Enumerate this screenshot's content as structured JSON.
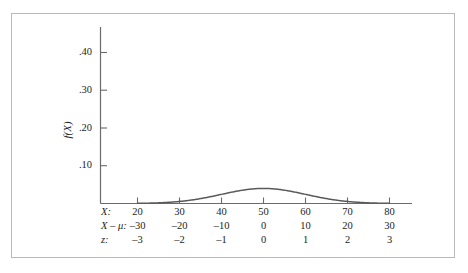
{
  "figure": {
    "border_color": "#b9b9b9",
    "background": "#ffffff"
  },
  "axes": {
    "curve_color": "#5a5a5a",
    "axis_color": "#6b6b6b",
    "y_title": "f(X)",
    "y_ticks": [
      ".10",
      ".20",
      ".30",
      ".40"
    ]
  },
  "rows": [
    {
      "name": "X:",
      "values": [
        "20",
        "30",
        "40",
        "50",
        "60",
        "70",
        "80"
      ]
    },
    {
      "name": "X – μ:",
      "values": [
        "–30",
        "–20",
        "–10",
        "0",
        "10",
        "20",
        "30"
      ]
    },
    {
      "name": "z:",
      "values": [
        "–3",
        "–2",
        "–1",
        "0",
        "1",
        "2",
        "3"
      ]
    }
  ],
  "chart_data": {
    "type": "line",
    "title": "",
    "xlabel": "",
    "ylabel": "f(X)",
    "xlim": [
      15,
      85
    ],
    "ylim": [
      0,
      0.44
    ],
    "grid": false,
    "legend": "none",
    "distribution": "normal",
    "mean": 50,
    "std_dev": 10,
    "peak_value": 0.3989,
    "x_tick_labels": [
      "20",
      "30",
      "40",
      "50",
      "60",
      "70",
      "80"
    ],
    "x_tick_values": [
      20,
      30,
      40,
      50,
      60,
      70,
      80
    ],
    "secondary_axis_deviation_labels": [
      "–30",
      "–20",
      "–10",
      "0",
      "10",
      "20",
      "30"
    ],
    "secondary_axis_z_labels": [
      "–3",
      "–2",
      "–1",
      "0",
      "1",
      "2",
      "3"
    ],
    "y_tick_labels": [
      ".10",
      ".20",
      ".30",
      ".40"
    ],
    "y_tick_values": [
      0.1,
      0.2,
      0.3,
      0.4
    ],
    "x": [
      20,
      22,
      24,
      26,
      28,
      30,
      32,
      34,
      36,
      38,
      40,
      42,
      44,
      46,
      48,
      50,
      52,
      54,
      56,
      58,
      60,
      62,
      64,
      66,
      68,
      70,
      72,
      74,
      76,
      78,
      80
    ],
    "values": [
      0.0044,
      0.0079,
      0.0136,
      0.0224,
      0.0355,
      0.054,
      0.079,
      0.1109,
      0.1497,
      0.1942,
      0.242,
      0.2897,
      0.3332,
      0.3683,
      0.391,
      0.3989,
      0.391,
      0.3683,
      0.3332,
      0.2897,
      0.242,
      0.1942,
      0.1497,
      0.1109,
      0.079,
      0.054,
      0.0355,
      0.0224,
      0.0136,
      0.0079,
      0.0044
    ]
  }
}
